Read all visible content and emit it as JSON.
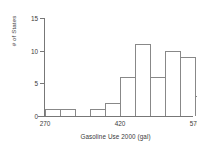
{
  "chart_data": {
    "type": "bar",
    "title": "",
    "subtitle": "",
    "xlabel": "Gasoline Use 2000 (gal)",
    "ylabel": "# of States",
    "xlim": [
      255,
      615
    ],
    "ylim": [
      0,
      15
    ],
    "grid": false,
    "legend": null,
    "bin_width": 30,
    "bin_starts": [
      270,
      300,
      330,
      360,
      390,
      420,
      450,
      480,
      510,
      540,
      570
    ],
    "categories": [
      "270-300",
      "300-330",
      "330-360",
      "360-390",
      "390-420",
      "420-450",
      "450-480",
      "480-510",
      "510-540",
      "540-570",
      "570-600"
    ],
    "values": [
      1,
      1,
      0,
      1,
      2,
      6,
      11,
      6,
      10,
      9,
      3
    ],
    "xticks": [
      270,
      300,
      330,
      360,
      390,
      420,
      450,
      480,
      510,
      540,
      570,
      600
    ],
    "xtick_labels": [
      "270",
      "",
      "",
      "",
      "",
      "420",
      "",
      "",
      "",
      "",
      "570",
      ""
    ],
    "yticks": [
      0,
      5,
      10,
      15
    ],
    "ytick_labels": [
      "0",
      "5",
      "10",
      "15"
    ],
    "colors": {
      "bar_edge": "#888888",
      "bar_fill": "#ffffff",
      "axis": "#777777",
      "text": "#3a3a3a",
      "background": "#ffffff"
    }
  }
}
